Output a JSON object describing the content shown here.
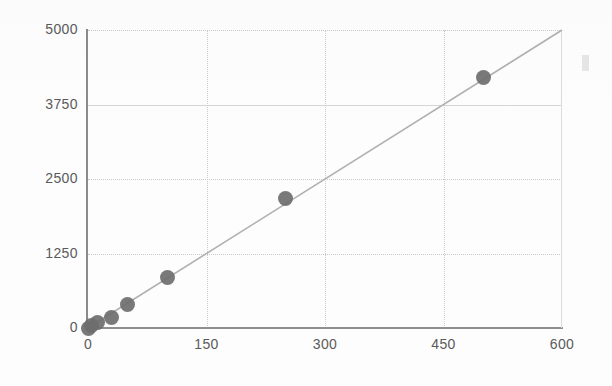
{
  "chart_data": {
    "type": "scatter",
    "title": "",
    "subtitle": "",
    "xlabel": "",
    "ylabel": "",
    "xlim": [
      0,
      600
    ],
    "ylim": [
      0,
      5000
    ],
    "xticks": [
      0,
      150,
      300,
      450,
      600
    ],
    "yticks": [
      0,
      1250,
      2500,
      3750,
      5000
    ],
    "xtick_labels": [
      "0",
      "150",
      "300",
      "450",
      "600"
    ],
    "ytick_labels": [
      "0",
      "1250",
      "2500",
      "3750",
      "5000"
    ],
    "grid": true,
    "legend": false,
    "legend_position": "none",
    "marker_color": "#6e6e6e",
    "line_color": "#b0b0b0",
    "axis_color": "#8b8b8b",
    "grid_color": "#c9c9c9",
    "tick_label_color": "#5a5a5a",
    "background_color": "#fdfdfd",
    "series": [
      {
        "name": "data",
        "type": "scatter",
        "points": [
          {
            "x": 0,
            "y": 0
          },
          {
            "x": 5,
            "y": 40
          },
          {
            "x": 12,
            "y": 100
          },
          {
            "x": 30,
            "y": 180
          },
          {
            "x": 50,
            "y": 390
          },
          {
            "x": 100,
            "y": 840
          },
          {
            "x": 250,
            "y": 2180
          },
          {
            "x": 500,
            "y": 4210
          }
        ]
      },
      {
        "name": "trend-line",
        "type": "line",
        "points": [
          {
            "x": 0,
            "y": 0
          },
          {
            "x": 600,
            "y": 5000
          }
        ]
      }
    ],
    "annotations": []
  },
  "artifact": {
    "label": "scan-artifact"
  }
}
